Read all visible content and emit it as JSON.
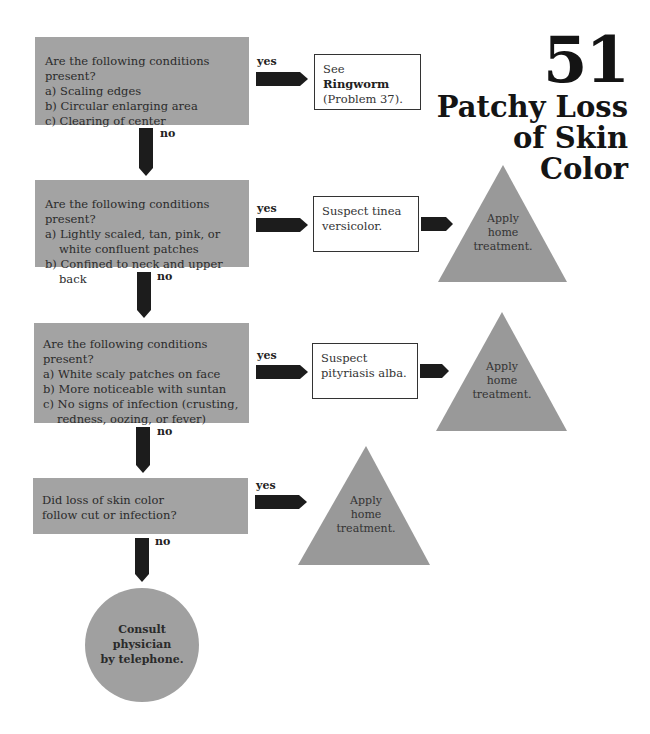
{
  "title": {
    "number": "51",
    "lines": [
      "Patchy Loss",
      "of Skin",
      "Color"
    ]
  },
  "labels": {
    "yes": "yes",
    "no": "no"
  },
  "questions": [
    {
      "prompt": "Are the following conditions present?",
      "items": [
        "a) Scaling edges",
        "b) Circular enlarging area",
        "c) Clearing of center"
      ]
    },
    {
      "prompt": "Are the following conditions present?",
      "items": [
        "a) Lightly scaled, tan, pink, or white confluent patches",
        "b) Confined to neck and upper back"
      ]
    },
    {
      "prompt": "Are the following conditions present?",
      "items": [
        "a) White scaly patches on face",
        "b) More noticeable with suntan",
        "c) No signs of infection (crusting, redness, oozing, or fever)"
      ]
    },
    {
      "prompt": "Did loss of skin color follow cut or infection?",
      "items": []
    }
  ],
  "outcomes": {
    "ringworm": {
      "prefix": "See ",
      "bold": "Ringworm",
      "suffix": "(Problem 37)."
    },
    "tinea": "Suspect tinea versicolor.",
    "pityriasis": "Suspect pityriasis alba.",
    "home_treatment": [
      "Apply",
      "home",
      "treatment."
    ],
    "consult": [
      "Consult",
      "physician",
      "by telephone."
    ]
  },
  "colors": {
    "question_fill": "#a3a3a3",
    "arrow_fill": "#1c1c1c",
    "triangle_fill": "#999999",
    "circle_fill": "#a0a0a0"
  }
}
